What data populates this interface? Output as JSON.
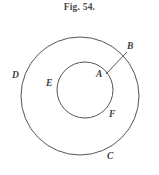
{
  "figure": {
    "caption": "Fig. 54.",
    "background_color": "#ffffff",
    "stroke_color": "#555555",
    "label_color": "#3d3d3d"
  },
  "chart_data": {
    "type": "diagram",
    "title": "Fig. 54.",
    "shapes": [
      {
        "name": "outer-circle",
        "kind": "circle",
        "cx": 80,
        "cy": 96,
        "r": 59,
        "fill": "none",
        "stroke": "#555555"
      },
      {
        "name": "inner-circle",
        "kind": "circle",
        "cx": 85,
        "cy": 90,
        "r": 28,
        "fill": "none",
        "stroke": "#555555"
      },
      {
        "name": "segment-ab",
        "kind": "line",
        "x1": 106,
        "y1": 74,
        "x2": 127,
        "y2": 52,
        "stroke": "#555555"
      }
    ],
    "points": [
      {
        "id": "B",
        "label": "B",
        "x": 131,
        "y": 47,
        "on": "outer-circle"
      },
      {
        "id": "A",
        "label": "A",
        "x": 100,
        "y": 75,
        "on": "inner-circle"
      },
      {
        "id": "D",
        "label": "D",
        "x": 16,
        "y": 76,
        "on": "outer-circle"
      },
      {
        "id": "E",
        "label": "E",
        "x": 50,
        "y": 84,
        "on": "inner-circle"
      },
      {
        "id": "F",
        "label": "F",
        "x": 112,
        "y": 115,
        "on": "inner-circle"
      },
      {
        "id": "C",
        "label": "C",
        "x": 110,
        "y": 157,
        "on": "outer-circle"
      }
    ]
  },
  "labels": {
    "b": "B",
    "a": "A",
    "d": "D",
    "e": "E",
    "f": "F",
    "c": "C"
  }
}
